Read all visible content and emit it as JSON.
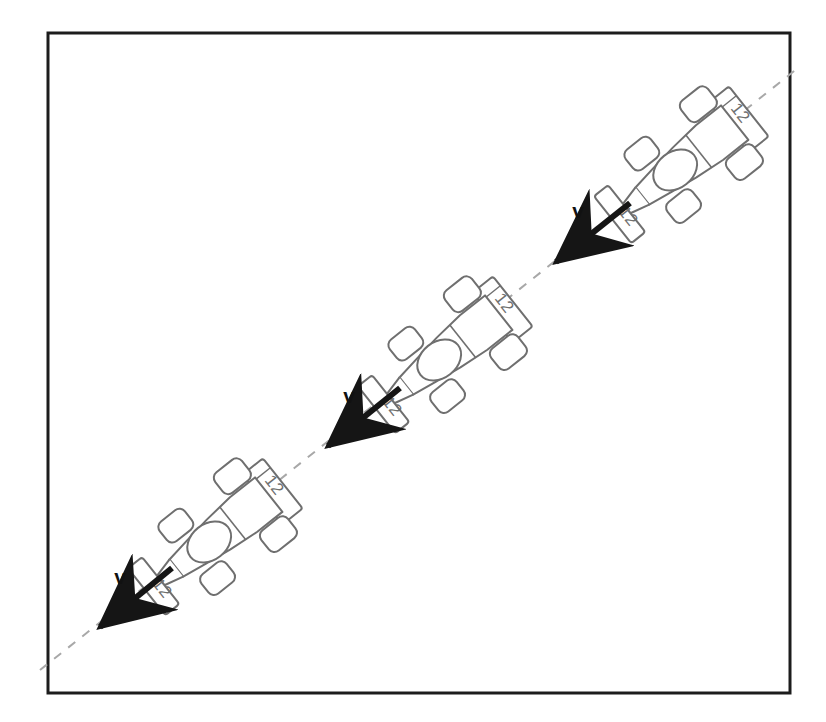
{
  "figure": {
    "type": "physics-motion-diagram",
    "background_color": "#ffffff",
    "frame": {
      "name": "figure-border",
      "x": 48,
      "y": 33,
      "width": 742,
      "height": 660,
      "stroke_color": "#1c1c1c",
      "stroke_width": 3,
      "fill": "none"
    },
    "trajectory": {
      "name": "motion-path",
      "style": "dashed",
      "stroke_color": "#a8a8a8",
      "stroke_width": 2,
      "dash_pattern": "9 9",
      "x1": 40,
      "y1": 670,
      "x2": 798,
      "y2": 68,
      "angle_degrees": -38.5,
      "description": "dashed line of motion running from lower-left to upper-right"
    },
    "cars": [
      {
        "id": "car-1",
        "label": "12",
        "cx": 694,
        "cy": 155,
        "rotation": -38.5,
        "scale": 1.0,
        "outline_color": "#6f6f6f",
        "fill_color": "#ffffff",
        "stroke_width": 2
      },
      {
        "id": "car-2",
        "label": "12",
        "cx": 458,
        "cy": 345,
        "rotation": -38.5,
        "scale": 1.0,
        "outline_color": "#6f6f6f",
        "fill_color": "#ffffff",
        "stroke_width": 2
      },
      {
        "id": "car-3",
        "label": "12",
        "cx": 228,
        "cy": 527,
        "rotation": -38.5,
        "scale": 1.0,
        "outline_color": "#6f6f6f",
        "fill_color": "#ffffff",
        "stroke_width": 2
      }
    ],
    "velocity_vectors": [
      {
        "id": "vector-1",
        "label": "v",
        "x1": 630,
        "y1": 203,
        "x2": 551,
        "y2": 266,
        "label_x": 578,
        "label_y": 218,
        "color": "#151515",
        "stroke_width": 6,
        "arrowhead": "barbed",
        "description": "velocity vector for the leading car"
      },
      {
        "id": "vector-2",
        "label": "v",
        "x1": 400,
        "y1": 388,
        "x2": 323,
        "y2": 450,
        "label_x": 349,
        "label_y": 403,
        "color": "#151515",
        "stroke_width": 6,
        "arrowhead": "barbed",
        "description": "velocity vector for the middle car"
      },
      {
        "id": "vector-3",
        "label": "v",
        "x1": 172,
        "y1": 568,
        "x2": 95,
        "y2": 631,
        "label_x": 120,
        "label_y": 584,
        "color": "#151515",
        "stroke_width": 6,
        "arrowhead": "barbed",
        "description": "velocity vector for the trailing car"
      }
    ]
  }
}
